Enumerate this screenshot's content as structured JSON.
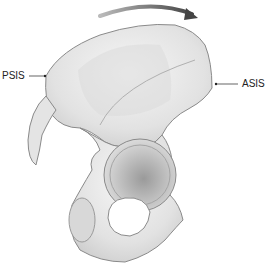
{
  "figure": {
    "labels": {
      "psis": "PSIS",
      "asis": "ASIS"
    },
    "colors": {
      "bone": "#e6e6e6",
      "bone_shadow": "#c8c8c8",
      "outline": "#8a8a8a",
      "arrow": "#555555",
      "text": "#222222"
    }
  }
}
